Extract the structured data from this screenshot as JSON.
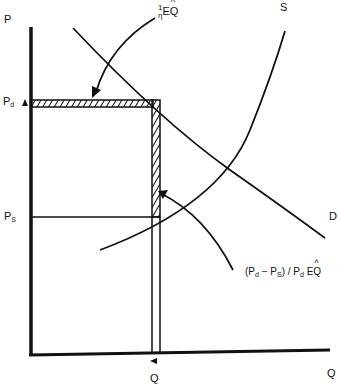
{
  "axes": {
    "y_label": "P",
    "x_label": "Q"
  },
  "curves": {
    "demand_label": "D",
    "supply_label": "S"
  },
  "prices": {
    "pd_main": "P",
    "pd_sub": "d",
    "ps_main": "P",
    "ps_sub": "S"
  },
  "quantity": {
    "q_label": "Q"
  },
  "annotations": {
    "top": {
      "num": "1",
      "den": "η",
      "expr": "E",
      "q": "Q"
    },
    "right": {
      "open": "(P",
      "sub1": "d",
      "minus": " − P",
      "sub2": "S",
      "mid": ") / P",
      "sub3": "d",
      "expr": " E",
      "q": "Q"
    }
  },
  "colors": {
    "ink": "#111111",
    "background": "#ffffff"
  }
}
